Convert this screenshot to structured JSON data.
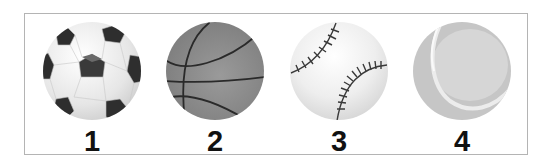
{
  "figure": {
    "items": [
      {
        "label": "1",
        "icon": "soccer-ball-icon"
      },
      {
        "label": "2",
        "icon": "basketball-icon"
      },
      {
        "label": "3",
        "icon": "baseball-icon"
      },
      {
        "label": "4",
        "icon": "tennis-ball-icon"
      }
    ]
  },
  "colors": {
    "border": "#b4b4b4",
    "label": "#111111",
    "soccer_dark": "#2e2e2e",
    "soccer_light": "#f2f2f2",
    "basketball": "#8a8a8a",
    "basketball_seam": "#2a2a2a",
    "baseball": "#eeeeee",
    "baseball_stitch": "#3a3a3a",
    "tennis": "#c8c8c8",
    "tennis_line": "#e8e8e8"
  }
}
